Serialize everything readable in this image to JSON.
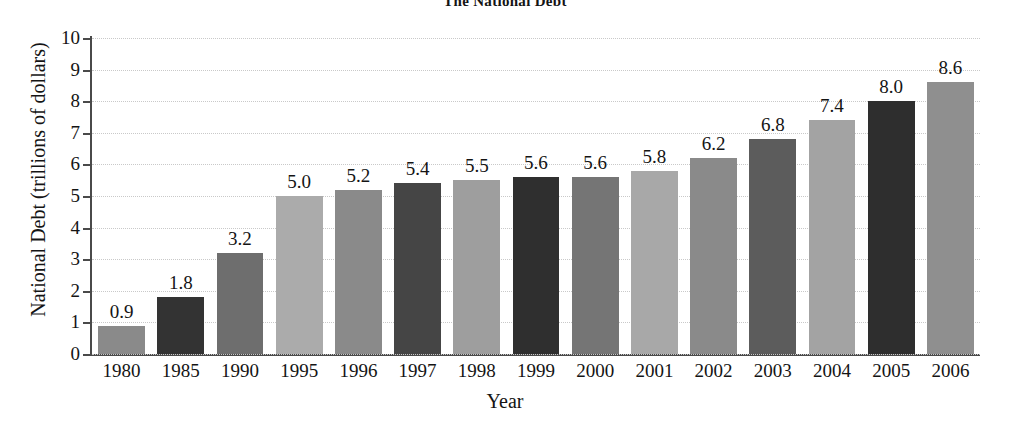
{
  "chart_data": {
    "type": "bar",
    "title": "The National Debt",
    "xlabel": "Year",
    "ylabel": "National Debt (trillions of dollars)",
    "categories": [
      "1980",
      "1985",
      "1990",
      "1995",
      "1996",
      "1997",
      "1998",
      "1999",
      "2000",
      "2001",
      "2002",
      "2003",
      "2004",
      "2005",
      "2006"
    ],
    "values": [
      0.9,
      1.8,
      3.2,
      5.0,
      5.2,
      5.4,
      5.5,
      5.6,
      5.6,
      5.8,
      6.2,
      6.8,
      7.4,
      8.0,
      8.6
    ],
    "value_labels": [
      "0.9",
      "1.8",
      "3.2",
      "5.0",
      "5.2",
      "5.4",
      "5.5",
      "5.6",
      "5.6",
      "5.8",
      "6.2",
      "6.8",
      "7.4",
      "8.0",
      "8.6"
    ],
    "ylim": [
      0,
      10
    ],
    "ytick_labels": [
      "10",
      "9",
      "8",
      "7",
      "6",
      "5",
      "4",
      "3",
      "2",
      "1",
      "0"
    ],
    "ytick_values": [
      10,
      9,
      8,
      7,
      6,
      5,
      4,
      3,
      2,
      1,
      0
    ],
    "grid": true,
    "grid_axis": "y",
    "legend": "none",
    "bar_colors": [
      "#8a8a8a",
      "#333333",
      "#6e6e6e",
      "#ababab",
      "#8a8a8a",
      "#454545",
      "#9e9e9e",
      "#2f2f2f",
      "#757575",
      "#a8a8a8",
      "#8a8a8a",
      "#5c5c5c",
      "#a3a3a3",
      "#2e2e2e",
      "#8f8f8f"
    ],
    "colors": {
      "axis": "#4a4a4a",
      "gridline": "#c9c9c9",
      "text": "#141414",
      "background": "#ffffff"
    }
  }
}
